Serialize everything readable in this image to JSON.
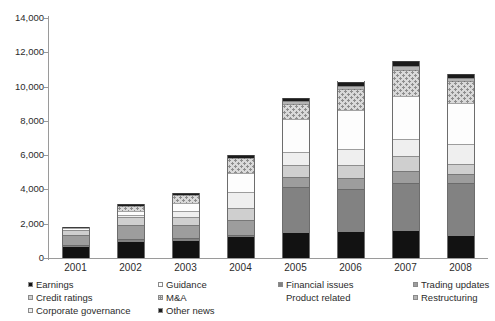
{
  "chart_data": {
    "type": "bar",
    "stacked": true,
    "title": "",
    "subtitle": "",
    "xlabel": "",
    "ylabel": "",
    "ylim": [
      0,
      14000
    ],
    "ytick_values": [
      0,
      2000,
      4000,
      6000,
      8000,
      10000,
      12000,
      14000
    ],
    "ytick_labels": [
      "0",
      "2,000",
      "4,000",
      "6,000",
      "8,000",
      "10,000",
      "12,000",
      "14,000"
    ],
    "grid": false,
    "legend_position": "bottom",
    "categories": [
      "2001",
      "2002",
      "2003",
      "2004",
      "2005",
      "2006",
      "2007",
      "2008"
    ],
    "series": [
      {
        "name": "Earnings",
        "color": "#121212",
        "swatch": "filled-black",
        "values": [
          650,
          950,
          980,
          1200,
          1450,
          1500,
          1600,
          1300
        ]
      },
      {
        "name": "Financial issues",
        "color": "#828282",
        "swatch": "filled-mid-gray",
        "values": [
          120,
          150,
          180,
          150,
          2700,
          2550,
          2800,
          3050
        ]
      },
      {
        "name": "Trading updates",
        "color": "#9d9d9d",
        "swatch": "filled-gray",
        "values": [
          550,
          800,
          780,
          850,
          550,
          600,
          700,
          550
        ]
      },
      {
        "name": "Credit ratings",
        "color": "#cfcfcf",
        "swatch": "filled-light-gray",
        "values": [
          300,
          500,
          450,
          700,
          700,
          800,
          850,
          600
        ]
      },
      {
        "name": "Product related",
        "color": "#efefef",
        "swatch": "none",
        "values": [
          0,
          100,
          380,
          950,
          800,
          900,
          1000,
          1150
        ]
      },
      {
        "name": "Guidance",
        "color": "#fdfdfd",
        "swatch": "open-white",
        "values": [
          130,
          250,
          420,
          1100,
          1900,
          2300,
          2500,
          2400
        ]
      },
      {
        "name": "M&A",
        "color": "#d9d9d9",
        "swatch": "dotted-pattern",
        "values": [
          0,
          300,
          500,
          900,
          900,
          1200,
          1500,
          1300
        ]
      },
      {
        "name": "Restructuring",
        "color": "#b4b4b4",
        "swatch": "filled-light-gray",
        "values": [
          0,
          0,
          0,
          0,
          150,
          200,
          250,
          180
        ]
      },
      {
        "name": "Other news",
        "color": "#1b1b1b",
        "swatch": "filled-black",
        "values": [
          50,
          80,
          110,
          150,
          200,
          250,
          300,
          200
        ]
      }
    ],
    "totals": [
      1800,
      3130,
      3800,
      6000,
      9350,
      10700,
      11500,
      10730
    ]
  },
  "legend": {
    "rows": [
      [
        {
          "label": "Earnings",
          "swatch_class": "f-earnings"
        },
        {
          "label": "Guidance",
          "swatch_class": "f-guidance"
        },
        {
          "label": "Financial issues",
          "swatch_class": "f-financial"
        },
        {
          "label": "Trading updates",
          "swatch_class": "f-trading"
        }
      ],
      [
        {
          "label": "Credit ratings",
          "swatch_class": "f-credit"
        },
        {
          "label": "M&A",
          "swatch_class": "f-mna"
        },
        {
          "label": "Product related",
          "swatch_class": "no-mark"
        },
        {
          "label": "Restructuring",
          "swatch_class": "f-restructuring"
        }
      ],
      [
        {
          "label": "Corporate governance",
          "swatch_class": "f-product"
        },
        {
          "label": "Other news",
          "swatch_class": "f-other"
        },
        {
          "label": "",
          "swatch_class": "no-mark"
        },
        {
          "label": "",
          "swatch_class": "no-mark"
        }
      ]
    ]
  }
}
